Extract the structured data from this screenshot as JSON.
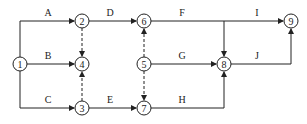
{
  "diagram": {
    "type": "activity-on-arrow network",
    "nodes": [
      {
        "id": "1",
        "label": "1",
        "x": 20,
        "y": 64
      },
      {
        "id": "2",
        "label": "2",
        "x": 82,
        "y": 21
      },
      {
        "id": "3",
        "label": "3",
        "x": 82,
        "y": 108
      },
      {
        "id": "4",
        "label": "4",
        "x": 82,
        "y": 64
      },
      {
        "id": "5",
        "label": "5",
        "x": 144,
        "y": 64
      },
      {
        "id": "6",
        "label": "6",
        "x": 144,
        "y": 21
      },
      {
        "id": "7",
        "label": "7",
        "x": 144,
        "y": 108
      },
      {
        "id": "8",
        "label": "8",
        "x": 224,
        "y": 64
      },
      {
        "id": "9",
        "label": "9",
        "x": 291,
        "y": 21
      }
    ],
    "activities": [
      {
        "label": "A",
        "from": "1",
        "to": "2",
        "lx": 48,
        "ly": 16
      },
      {
        "label": "B",
        "from": "1",
        "to": "4",
        "lx": 48,
        "ly": 59
      },
      {
        "label": "C",
        "from": "1",
        "to": "3",
        "lx": 48,
        "ly": 103
      },
      {
        "label": "D",
        "from": "2",
        "to": "6",
        "lx": 110,
        "ly": 16
      },
      {
        "label": "E",
        "from": "3",
        "to": "7",
        "lx": 110,
        "ly": 103
      },
      {
        "label": "F",
        "from": "6",
        "to": "8",
        "lx": 182,
        "ly": 16
      },
      {
        "label": "G",
        "from": "5",
        "to": "8",
        "lx": 182,
        "ly": 59
      },
      {
        "label": "H",
        "from": "7",
        "to": "8",
        "lx": 182,
        "ly": 103
      },
      {
        "label": "I",
        "from": "6",
        "to": "9",
        "lx": 257,
        "ly": 16
      },
      {
        "label": "J",
        "from": "8",
        "to": "9",
        "lx": 257,
        "ly": 59
      }
    ],
    "dummy_activities": [
      {
        "from": "2",
        "to": "4"
      },
      {
        "from": "3",
        "to": "4"
      },
      {
        "from": "5",
        "to": "6"
      },
      {
        "from": "5",
        "to": "7"
      }
    ]
  }
}
